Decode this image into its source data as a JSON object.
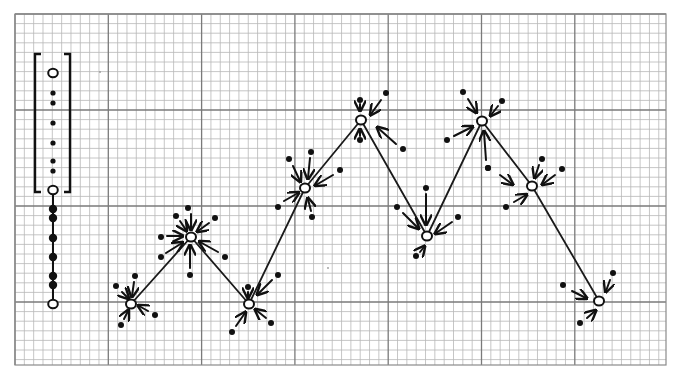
{
  "diagram": {
    "colors": {
      "paper": "#ffffff",
      "grid_minor": "#b8b8b8",
      "grid_major": "#7a7a7a",
      "ink": "#111111"
    },
    "grid": {
      "left": 15,
      "right": 666,
      "top": 14,
      "bottom": 365,
      "minor_x": 9.33,
      "minor_y": 9.6,
      "major_every": 10
    },
    "legend_column": {
      "x": 53,
      "bracket": {
        "left_x": 35,
        "right_x": 70,
        "top_y": 54,
        "bottom_y": 192
      },
      "open_circles_y": [
        73,
        190,
        304
      ],
      "small_dots_y": [
        93,
        103,
        123,
        143,
        161,
        171
      ],
      "large_dots_y": [
        209,
        218,
        238,
        257,
        276,
        285
      ],
      "stem": {
        "from_y": 194,
        "to_y": 300
      }
    },
    "nodes": [
      {
        "id": "n1",
        "x": 131,
        "y": 304
      },
      {
        "id": "n2",
        "x": 191,
        "y": 237
      },
      {
        "id": "n3",
        "x": 249,
        "y": 304
      },
      {
        "id": "n4",
        "x": 305,
        "y": 188
      },
      {
        "id": "n5",
        "x": 361,
        "y": 120
      },
      {
        "id": "n6",
        "x": 427,
        "y": 236
      },
      {
        "id": "n7",
        "x": 482,
        "y": 121
      },
      {
        "id": "n8",
        "x": 532,
        "y": 186
      },
      {
        "id": "n9",
        "x": 599,
        "y": 301
      }
    ],
    "satellites": [
      {
        "node": "n1",
        "dot": [
          116,
          286
        ],
        "arrow": [
          [
            122,
            292
          ],
          [
            128,
            298
          ]
        ]
      },
      {
        "node": "n1",
        "dot": [
          135,
          276
        ],
        "arrow": [
          [
            134,
            282
          ],
          [
            132,
            296
          ]
        ]
      },
      {
        "node": "n1",
        "dot": [
          155,
          315
        ],
        "arrow": [
          [
            148,
            311
          ],
          [
            139,
            306
          ]
        ]
      },
      {
        "node": "n1",
        "dot": [
          121,
          325
        ],
        "arrow": [
          [
            124,
            319
          ],
          [
            128,
            311
          ]
        ]
      },
      {
        "node": "n2",
        "dot": [
          188,
          208
        ],
        "arrow": [
          [
            191,
            214
          ],
          [
            191,
            229
          ]
        ]
      },
      {
        "node": "n2",
        "dot": [
          176,
          216
        ],
        "arrow": [
          [
            180,
            221
          ],
          [
            186,
            230
          ]
        ]
      },
      {
        "node": "n2",
        "dot": [
          215,
          218
        ],
        "arrow": [
          [
            209,
            223
          ],
          [
            198,
            231
          ]
        ]
      },
      {
        "node": "n2",
        "dot": [
          161,
          237
        ],
        "arrow": [
          [
            167,
            236
          ],
          [
            182,
            236
          ]
        ]
      },
      {
        "node": "n2",
        "dot": [
          161,
          257
        ],
        "arrow": [
          [
            166,
            253
          ],
          [
            182,
            243
          ]
        ]
      },
      {
        "node": "n2",
        "dot": [
          190,
          275
        ],
        "arrow": [
          [
            190,
            268
          ],
          [
            190,
            246
          ]
        ]
      },
      {
        "node": "n2",
        "dot": [
          225,
          257
        ],
        "arrow": [
          [
            218,
            252
          ],
          [
            200,
            242
          ]
        ]
      },
      {
        "node": "n3",
        "dot": [
          248,
          287
        ],
        "arrow": [
          [
            248,
            292
          ],
          [
            248,
            297
          ]
        ]
      },
      {
        "node": "n3",
        "dot": [
          278,
          275
        ],
        "arrow": [
          [
            272,
            280
          ],
          [
            258,
            294
          ]
        ]
      },
      {
        "node": "n3",
        "dot": [
          232,
          332
        ],
        "arrow": [
          [
            236,
            326
          ],
          [
            245,
            313
          ]
        ]
      },
      {
        "node": "n3",
        "dot": [
          271,
          323
        ],
        "arrow": [
          [
            266,
            318
          ],
          [
            256,
            310
          ]
        ]
      },
      {
        "node": "n4",
        "dot": [
          289,
          159
        ],
        "arrow": [
          [
            293,
            166
          ],
          [
            300,
            181
          ]
        ]
      },
      {
        "node": "n4",
        "dot": [
          311,
          152
        ],
        "arrow": [
          [
            310,
            158
          ],
          [
            308,
            178
          ]
        ]
      },
      {
        "node": "n4",
        "dot": [
          340,
          170
        ],
        "arrow": [
          [
            333,
            175
          ],
          [
            316,
            185
          ]
        ]
      },
      {
        "node": "n4",
        "dot": [
          278,
          207
        ],
        "arrow": [
          [
            284,
            201
          ],
          [
            298,
            193
          ]
        ]
      },
      {
        "node": "n4",
        "dot": [
          312,
          217
        ],
        "arrow": [
          [
            311,
            211
          ],
          [
            308,
            199
          ]
        ]
      },
      {
        "node": "n5",
        "dot": [
          360,
          100
        ],
        "arrow": [
          [
            360,
            104
          ],
          [
            360,
            110
          ]
        ]
      },
      {
        "node": "n5",
        "dot": [
          386,
          93
        ],
        "arrow": [
          [
            381,
            100
          ],
          [
            371,
            114
          ]
        ]
      },
      {
        "node": "n5",
        "dot": [
          360,
          140
        ],
        "arrow": [
          [
            360,
            136
          ],
          [
            360,
            130
          ]
        ]
      },
      {
        "node": "n5",
        "dot": [
          403,
          149
        ],
        "arrow": [
          [
            396,
            144
          ],
          [
            378,
            128
          ]
        ]
      },
      {
        "node": "n6",
        "dot": [
          426,
          188
        ],
        "arrow": [
          [
            426,
            194
          ],
          [
            426,
            224
          ]
        ]
      },
      {
        "node": "n6",
        "dot": [
          397,
          207
        ],
        "arrow": [
          [
            403,
            213
          ],
          [
            418,
            228
          ]
        ]
      },
      {
        "node": "n6",
        "dot": [
          458,
          217
        ],
        "arrow": [
          [
            452,
            222
          ],
          [
            436,
            233
          ]
        ]
      },
      {
        "node": "n6",
        "dot": [
          416,
          256
        ],
        "arrow": [
          [
            420,
            252
          ],
          [
            424,
            247
          ]
        ]
      },
      {
        "node": "n7",
        "dot": [
          463,
          92
        ],
        "arrow": [
          [
            468,
            99
          ],
          [
            476,
            112
          ]
        ]
      },
      {
        "node": "n7",
        "dot": [
          502,
          101
        ],
        "arrow": [
          [
            498,
            106
          ],
          [
            491,
            115
          ]
        ]
      },
      {
        "node": "n7",
        "dot": [
          447,
          140
        ],
        "arrow": [
          [
            454,
            136
          ],
          [
            472,
            127
          ]
        ]
      },
      {
        "node": "n7",
        "dot": [
          488,
          168
        ],
        "arrow": [
          [
            486,
            160
          ],
          [
            484,
            132
          ]
        ]
      },
      {
        "node": "n8",
        "dot": [
          488,
          168
        ],
        "arrow": [
          [
            500,
            175
          ],
          [
            512,
            184
          ]
        ]
      },
      {
        "node": "n8",
        "dot": [
          542,
          159
        ],
        "arrow": [
          [
            539,
            165
          ],
          [
            535,
            177
          ]
        ]
      },
      {
        "node": "n8",
        "dot": [
          562,
          169
        ],
        "arrow": [
          [
            555,
            175
          ],
          [
            543,
            184
          ]
        ]
      },
      {
        "node": "n8",
        "dot": [
          506,
          207
        ],
        "arrow": [
          [
            514,
            202
          ],
          [
            526,
            195
          ]
        ]
      },
      {
        "node": "n9",
        "dot": [
          563,
          285
        ],
        "arrow": [
          [
            572,
            291
          ],
          [
            586,
            298
          ]
        ]
      },
      {
        "node": "n9",
        "dot": [
          613,
          273
        ],
        "arrow": [
          [
            610,
            280
          ],
          [
            606,
            291
          ]
        ]
      },
      {
        "node": "n9",
        "dot": [
          580,
          323
        ],
        "arrow": [
          [
            587,
            318
          ],
          [
            595,
            311
          ]
        ]
      }
    ],
    "stray_marks": [
      {
        "x": 100,
        "y": 72
      },
      {
        "x": 328,
        "y": 268
      }
    ]
  }
}
